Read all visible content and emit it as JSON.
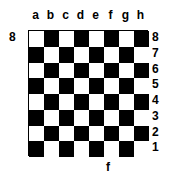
{
  "board": {
    "files": [
      "a",
      "b",
      "c",
      "d",
      "e",
      "f",
      "g",
      "h"
    ],
    "ranks": [
      "8",
      "7",
      "6",
      "5",
      "4",
      "3",
      "2",
      "1"
    ],
    "left_label": "8",
    "bottom_label": "f",
    "colors": {
      "light": "#ffffff",
      "dark": "#000000"
    },
    "top_left_square": "light"
  }
}
